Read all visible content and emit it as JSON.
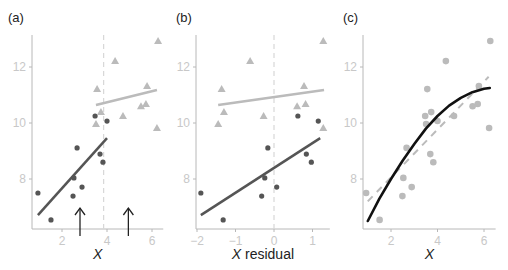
{
  "chart_data": [
    {
      "panel": "(a)",
      "type": "scatter",
      "xlabel": "X",
      "ylabel": "",
      "xlim": [
        0.7,
        6.5
      ],
      "ylim": [
        6.2,
        13.4
      ],
      "xticks": [
        2,
        4,
        6
      ],
      "yticks": [
        8,
        10,
        12
      ],
      "grid": false,
      "threshold_line": {
        "x": 3.85,
        "style": "dashed",
        "color": "#d8d8d8"
      },
      "arrows": [
        {
          "x": 2.8,
          "direction": "up"
        },
        {
          "x": 4.95,
          "direction": "up"
        }
      ],
      "series": [
        {
          "name": "below threshold",
          "marker": "circle",
          "color": "#555555",
          "points": [
            [
              0.93,
              7.5
            ],
            [
              1.51,
              6.54
            ],
            [
              2.67,
              9.11
            ],
            [
              2.53,
              8.04
            ],
            [
              2.49,
              7.39
            ],
            [
              2.89,
              7.71
            ],
            [
              3.47,
              10.25
            ],
            [
              4.0,
              10.07
            ],
            [
              3.69,
              8.89
            ],
            [
              3.82,
              8.6
            ]
          ],
          "fit_line": {
            "x": [
              0.93,
              4.0
            ],
            "y": [
              6.71,
              9.46
            ],
            "color": "#555555"
          }
        },
        {
          "name": "above threshold",
          "marker": "triangle",
          "color": "#bbbbbb",
          "points": [
            [
              3.56,
              11.21
            ],
            [
              4.36,
              12.21
            ],
            [
              3.73,
              10.39
            ],
            [
              3.51,
              9.96
            ],
            [
              4.71,
              10.25
            ],
            [
              5.51,
              10.6
            ],
            [
              5.73,
              10.68
            ],
            [
              5.78,
              11.32
            ],
            [
              6.27,
              12.93
            ],
            [
              6.22,
              9.82
            ]
          ],
          "fit_line": {
            "x": [
              3.51,
              6.22
            ],
            "y": [
              10.64,
              11.18
            ],
            "color": "#bbbbbb"
          }
        }
      ]
    },
    {
      "panel": "(b)",
      "type": "scatter",
      "xlabel": "X residual",
      "ylabel": "",
      "xlim": [
        -2.05,
        1.45
      ],
      "ylim": [
        6.2,
        13.4
      ],
      "xticks": [
        -2,
        -1,
        0,
        1
      ],
      "yticks": [
        8,
        10,
        12
      ],
      "grid": false,
      "threshold_line": {
        "x": 0,
        "style": "dashed",
        "color": "#d8d8d8"
      },
      "series": [
        {
          "name": "below threshold",
          "marker": "circle",
          "color": "#555555",
          "points": [
            [
              -1.9,
              7.5
            ],
            [
              -1.32,
              6.54
            ],
            [
              -0.16,
              9.11
            ],
            [
              -0.24,
              8.04
            ],
            [
              -0.32,
              7.39
            ],
            [
              0.07,
              7.71
            ],
            [
              0.62,
              10.25
            ],
            [
              1.15,
              10.07
            ],
            [
              0.84,
              8.89
            ],
            [
              0.97,
              8.6
            ]
          ],
          "fit_line": {
            "x": [
              -1.9,
              1.2
            ],
            "y": [
              6.71,
              9.46
            ],
            "color": "#555555"
          }
        },
        {
          "name": "above threshold",
          "marker": "triangle",
          "color": "#bbbbbb",
          "points": [
            [
              -1.36,
              11.21
            ],
            [
              -0.62,
              12.21
            ],
            [
              -1.3,
              10.39
            ],
            [
              -1.45,
              9.96
            ],
            [
              -0.27,
              10.25
            ],
            [
              0.6,
              10.6
            ],
            [
              0.82,
              10.68
            ],
            [
              0.78,
              11.32
            ],
            [
              1.28,
              12.93
            ],
            [
              1.28,
              9.82
            ]
          ],
          "fit_line": {
            "x": [
              -1.45,
              1.3
            ],
            "y": [
              10.64,
              11.18
            ],
            "color": "#bbbbbb"
          }
        }
      ]
    },
    {
      "panel": "(c)",
      "type": "scatter",
      "xlabel": "X",
      "ylabel": "",
      "xlim": [
        0.7,
        6.5
      ],
      "ylim": [
        6.2,
        13.4
      ],
      "xticks": [
        2,
        4,
        6
      ],
      "yticks": [
        8,
        10,
        12
      ],
      "grid": false,
      "series": [
        {
          "name": "all points",
          "marker": "circle",
          "color": "#bbbbbb",
          "points": [
            [
              0.93,
              7.5
            ],
            [
              1.51,
              6.54
            ],
            [
              2.67,
              9.11
            ],
            [
              2.53,
              8.04
            ],
            [
              2.49,
              7.39
            ],
            [
              2.89,
              7.71
            ],
            [
              3.47,
              10.25
            ],
            [
              4.0,
              10.07
            ],
            [
              3.69,
              8.89
            ],
            [
              3.82,
              8.6
            ],
            [
              3.56,
              11.21
            ],
            [
              4.36,
              12.21
            ],
            [
              3.73,
              10.39
            ],
            [
              3.51,
              9.96
            ],
            [
              4.71,
              10.25
            ],
            [
              5.51,
              10.6
            ],
            [
              5.73,
              10.68
            ],
            [
              5.78,
              11.32
            ],
            [
              6.27,
              12.93
            ],
            [
              6.22,
              9.82
            ]
          ]
        }
      ],
      "linear_fit": {
        "x": [
          1.0,
          6.2
        ],
        "y": [
          7.2,
          11.65
        ],
        "style": "dashed",
        "color": "#bbbbbb"
      },
      "smooth_fit": {
        "x": [
          1.0,
          1.5,
          2.0,
          2.5,
          3.0,
          3.5,
          4.0,
          4.5,
          5.0,
          5.5,
          6.0,
          6.25
        ],
        "y": [
          6.5,
          7.3,
          8.0,
          8.65,
          9.25,
          9.8,
          10.25,
          10.62,
          10.9,
          11.1,
          11.22,
          11.25
        ],
        "style": "solid",
        "color": "#111111"
      }
    }
  ]
}
